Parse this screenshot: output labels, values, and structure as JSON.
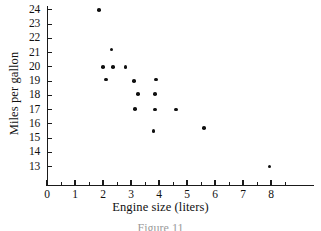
{
  "chart_data": {
    "type": "scatter",
    "title": "",
    "xlabel": "Engine size (liters)",
    "ylabel": "Miles per gallon",
    "xlim": [
      0,
      8.6
    ],
    "ylim": [
      12.4,
      24.6
    ],
    "grid": false,
    "legend": null,
    "x_ticks": [
      "0",
      "1",
      "2",
      "3",
      "4",
      "5",
      "6",
      "7",
      "8"
    ],
    "x_tick_values": [
      0,
      1,
      2,
      3,
      4,
      5,
      6,
      7,
      8
    ],
    "x_minor_ticks": [
      0.5,
      1.5,
      2.5,
      3.5,
      4.5,
      5.5,
      6.5,
      7.5,
      8.5
    ],
    "y_ticks": [
      "13",
      "14",
      "15",
      "16",
      "17",
      "18",
      "19",
      "20",
      "21",
      "22",
      "23",
      "24"
    ],
    "y_tick_values": [
      13,
      14,
      15,
      16,
      17,
      18,
      19,
      20,
      21,
      22,
      23,
      24
    ],
    "marker": "filled-circle",
    "marker_color": "#101010",
    "points": [
      {
        "x": 1.85,
        "y": 24.0
      },
      {
        "x": 2.3,
        "y": 21.2
      },
      {
        "x": 2.0,
        "y": 20.0
      },
      {
        "x": 2.35,
        "y": 20.0
      },
      {
        "x": 2.8,
        "y": 20.0
      },
      {
        "x": 2.1,
        "y": 19.1
      },
      {
        "x": 3.1,
        "y": 19.0
      },
      {
        "x": 3.9,
        "y": 19.1
      },
      {
        "x": 3.25,
        "y": 18.1
      },
      {
        "x": 3.85,
        "y": 18.1
      },
      {
        "x": 3.15,
        "y": 17.05
      },
      {
        "x": 3.85,
        "y": 17.0
      },
      {
        "x": 4.6,
        "y": 17.0
      },
      {
        "x": 3.8,
        "y": 15.5
      },
      {
        "x": 5.6,
        "y": 15.7
      },
      {
        "x": 7.95,
        "y": 13.0
      }
    ]
  },
  "caption": {
    "text": "Figure 11"
  }
}
